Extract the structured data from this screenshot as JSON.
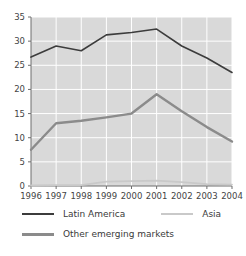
{
  "title_partial": "",
  "legend": {
    "position": "below",
    "items": [
      {
        "label": "Latin America",
        "color": "#3c3c3c",
        "swatch": "line-swatch-latin-america"
      },
      {
        "label": "Asia",
        "color": "#c9c9c9",
        "swatch": "line-swatch-asia"
      },
      {
        "label": "Other emerging markets",
        "color": "#8b8b8b",
        "swatch": "line-swatch-other-emerging-markets"
      }
    ]
  },
  "axes": {
    "y_ticks": [
      "0",
      "5",
      "10",
      "15",
      "20",
      "25",
      "30",
      "35"
    ],
    "x_ticks": [
      "1996",
      "1997",
      "1998",
      "1999",
      "2000",
      "2001",
      "2002",
      "2003",
      "2004"
    ]
  },
  "colors": {
    "plot_background": "#d9d9d9",
    "gridline": "#ffffff",
    "axis": "#6e6e6e",
    "latin_america": "#3c3c3c",
    "other_emerging_markets": "#8b8b8b",
    "asia": "#c9c9c9",
    "text": "#3a3a3a"
  },
  "chart_data": {
    "type": "line",
    "title": "",
    "xlabel": "",
    "ylabel": "",
    "x": [
      "1996",
      "1997",
      "1998",
      "1999",
      "2000",
      "2001",
      "2002",
      "2003",
      "2004"
    ],
    "categories": [
      "1996",
      "1997",
      "1998",
      "1999",
      "2000",
      "2001",
      "2002",
      "2003",
      "2004"
    ],
    "ylim": [
      0,
      35
    ],
    "yticks": [
      0,
      5,
      10,
      15,
      20,
      25,
      30,
      35
    ],
    "grid": true,
    "legend_position": "bottom",
    "series": [
      {
        "name": "Latin America",
        "color": "#3c3c3c",
        "values": [
          26.7,
          29.0,
          28.0,
          31.3,
          31.8,
          32.5,
          29.0,
          26.5,
          23.5
        ]
      },
      {
        "name": "Other emerging markets",
        "color": "#8b8b8b",
        "values": [
          7.5,
          13.0,
          13.5,
          14.2,
          15.0,
          19.0,
          15.5,
          12.2,
          9.2
        ]
      },
      {
        "name": "Asia",
        "color": "#c9c9c9",
        "values": [
          0.1,
          0.2,
          0.2,
          0.9,
          1.0,
          1.1,
          0.8,
          0.4,
          0.3
        ]
      }
    ]
  }
}
